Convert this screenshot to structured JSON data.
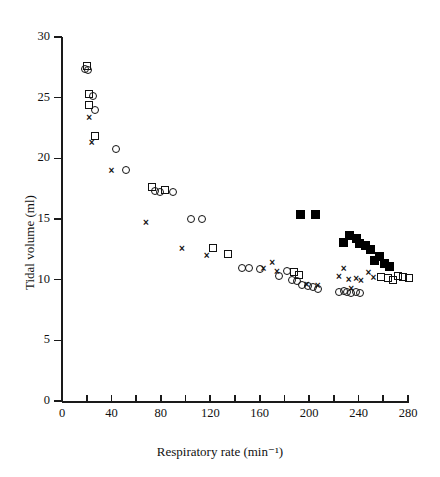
{
  "chart_data": {
    "type": "scatter",
    "title": "",
    "xlabel": "Respiratory rate (min⁻¹)",
    "ylabel": "Tidal volume (ml)",
    "xlim": [
      0,
      280
    ],
    "ylim": [
      0,
      30
    ],
    "xticks": [
      0,
      40,
      80,
      120,
      160,
      200,
      240,
      280
    ],
    "xtick_labels": [
      "0",
      "40",
      "80",
      "120",
      "160",
      "200",
      "240",
      "280"
    ],
    "xminor_step": 20,
    "yticks": [
      0,
      5,
      10,
      15,
      20,
      25,
      30
    ],
    "ytick_labels": [
      "0",
      "5",
      "10",
      "15",
      "20",
      "25",
      "30"
    ],
    "grid": false,
    "legend": "none",
    "series": [
      {
        "name": "open-circle",
        "marker": "circle",
        "points": [
          [
            19,
            27.4
          ],
          [
            21,
            27.3
          ],
          [
            25,
            25.1
          ],
          [
            27,
            24.0
          ],
          [
            44,
            20.8
          ],
          [
            52,
            19.0
          ],
          [
            75,
            17.3
          ],
          [
            79,
            17.2
          ],
          [
            90,
            17.2
          ],
          [
            104,
            15.0
          ],
          [
            113,
            15.0
          ],
          [
            146,
            11.0
          ],
          [
            151,
            11.0
          ],
          [
            160,
            10.9
          ],
          [
            176,
            10.3
          ],
          [
            182,
            10.7
          ],
          [
            186,
            10.0
          ],
          [
            190,
            9.9
          ],
          [
            194,
            9.6
          ],
          [
            199,
            9.5
          ],
          [
            203,
            9.4
          ],
          [
            207,
            9.2
          ],
          [
            224,
            9.0
          ],
          [
            228,
            9.1
          ],
          [
            231,
            9.0
          ],
          [
            234,
            8.9
          ],
          [
            238,
            9.0
          ],
          [
            241,
            8.9
          ]
        ]
      },
      {
        "name": "open-square",
        "marker": "square",
        "points": [
          [
            20,
            27.6
          ],
          [
            22,
            25.3
          ],
          [
            22,
            24.4
          ],
          [
            27,
            21.8
          ],
          [
            73,
            17.6
          ],
          [
            83,
            17.4
          ],
          [
            122,
            12.6
          ],
          [
            134,
            12.1
          ],
          [
            188,
            10.6
          ],
          [
            192,
            10.4
          ],
          [
            258,
            10.2
          ],
          [
            264,
            10.1
          ],
          [
            268,
            10.0
          ],
          [
            272,
            10.3
          ],
          [
            276,
            10.2
          ],
          [
            281,
            10.1
          ]
        ]
      },
      {
        "name": "cross",
        "marker": "cross",
        "points": [
          [
            22,
            23.4
          ],
          [
            24,
            21.3
          ],
          [
            40,
            19.0
          ],
          [
            68,
            14.7
          ],
          [
            97,
            12.6
          ],
          [
            117,
            12.0
          ],
          [
            163,
            10.9
          ],
          [
            170,
            11.4
          ],
          [
            174,
            10.7
          ],
          [
            198,
            9.6
          ],
          [
            207,
            9.5
          ],
          [
            224,
            10.3
          ],
          [
            228,
            10.9
          ],
          [
            232,
            10.0
          ],
          [
            234,
            9.3
          ],
          [
            238,
            10.1
          ],
          [
            242,
            9.9
          ],
          [
            248,
            10.6
          ],
          [
            252,
            10.2
          ]
        ]
      },
      {
        "name": "filled-square",
        "marker": "filled-square",
        "points": [
          [
            193,
            15.4
          ],
          [
            205,
            15.4
          ],
          [
            228,
            13.1
          ],
          [
            233,
            13.6
          ],
          [
            238,
            13.4
          ],
          [
            241,
            13.0
          ],
          [
            246,
            12.8
          ],
          [
            250,
            12.5
          ],
          [
            253,
            11.6
          ],
          [
            257,
            11.9
          ],
          [
            261,
            11.3
          ],
          [
            265,
            11.1
          ]
        ]
      }
    ]
  },
  "axes": {
    "x_axis_name": "x-axis",
    "y_axis_name": "y-axis"
  }
}
